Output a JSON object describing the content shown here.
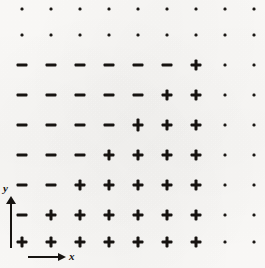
{
  "figure": {
    "title": "",
    "background_color": "#fbfaf8",
    "ink_color": "#161310"
  },
  "axes": {
    "x": {
      "label": "x",
      "arrow_direction": "right",
      "name": "x-axis"
    },
    "y": {
      "label": "y",
      "arrow_direction": "up",
      "name": "y-axis"
    }
  },
  "chart_data": {
    "type": "heatmap",
    "title": "",
    "xlabel": "x",
    "ylabel": "y",
    "grid": false,
    "legend": "none",
    "symbol_legend": {
      "+": "positive",
      "-": "negative",
      ".": "zero / negligible"
    },
    "columns": 9,
    "rows": 9,
    "x": [
      1,
      2,
      3,
      4,
      5,
      6,
      7,
      8,
      9
    ],
    "y": [
      9,
      8,
      7,
      6,
      5,
      4,
      3,
      2,
      1
    ],
    "x_pixels": [
      22,
      51,
      80,
      109,
      138,
      167,
      196,
      225,
      254
    ],
    "y_pixels": [
      9,
      35,
      65,
      95,
      125,
      155,
      185,
      215,
      242
    ],
    "symbols": [
      [
        ".",
        ".",
        ".",
        ".",
        ".",
        ".",
        ".",
        ".",
        "."
      ],
      [
        ".",
        ".",
        ".",
        ".",
        ".",
        ".",
        ".",
        ".",
        "."
      ],
      [
        "-",
        "-",
        "-",
        "-",
        "-",
        "-",
        "+",
        ".",
        "."
      ],
      [
        "-",
        "-",
        "-",
        "-",
        "-",
        "+",
        "+",
        ".",
        "."
      ],
      [
        "-",
        "-",
        "-",
        "-",
        "+",
        "+",
        "+",
        ".",
        "."
      ],
      [
        "-",
        "-",
        "-",
        "+",
        "+",
        "+",
        "+",
        ".",
        "."
      ],
      [
        "-",
        "-",
        "+",
        "+",
        "+",
        "+",
        "+",
        ".",
        "."
      ],
      [
        "-",
        "+",
        "+",
        "+",
        "+",
        "+",
        "+",
        ".",
        "."
      ],
      [
        "+",
        "+",
        "+",
        "+",
        "+",
        "+",
        "+",
        ".",
        "."
      ]
    ],
    "values": [
      [
        0,
        0,
        0,
        0,
        0,
        0,
        0,
        0,
        0
      ],
      [
        0,
        0,
        0,
        0,
        0,
        0,
        0,
        0,
        0
      ],
      [
        -1,
        -1,
        -1,
        -1,
        -1,
        -1,
        1,
        0,
        0
      ],
      [
        -1,
        -1,
        -1,
        -1,
        -1,
        1,
        1,
        0,
        0
      ],
      [
        -1,
        -1,
        -1,
        -1,
        1,
        1,
        1,
        0,
        0
      ],
      [
        -1,
        -1,
        -1,
        1,
        1,
        1,
        1,
        0,
        0
      ],
      [
        -1,
        -1,
        1,
        1,
        1,
        1,
        1,
        0,
        0
      ],
      [
        -1,
        1,
        1,
        1,
        1,
        1,
        1,
        0,
        0
      ],
      [
        1,
        1,
        1,
        1,
        1,
        1,
        1,
        0,
        0
      ]
    ],
    "blemished_cells": [
      [
        4,
        4
      ]
    ],
    "counts": {
      "plus": 28,
      "minus": 21,
      "dot": 32,
      "total": 81
    }
  }
}
